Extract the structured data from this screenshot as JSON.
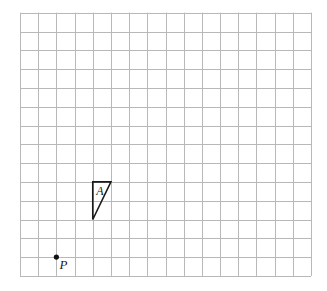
{
  "grid": {
    "columns": 16,
    "rows": 14,
    "origin_x": 20,
    "origin_y": 12.7,
    "cell_w": 18.19,
    "cell_h": 18.8,
    "line_color": "#b8b8b8"
  },
  "shapes": [
    {
      "name": "triangle-A",
      "label": "A",
      "vertices_grid": [
        [
          4,
          9
        ],
        [
          5,
          9
        ],
        [
          4,
          11
        ]
      ],
      "label_grid": [
        4.25,
        9.75
      ]
    }
  ],
  "points": [
    {
      "name": "point-P",
      "label": "P",
      "position_grid": [
        2,
        13
      ],
      "label_offset": [
        3,
        13
      ]
    }
  ]
}
